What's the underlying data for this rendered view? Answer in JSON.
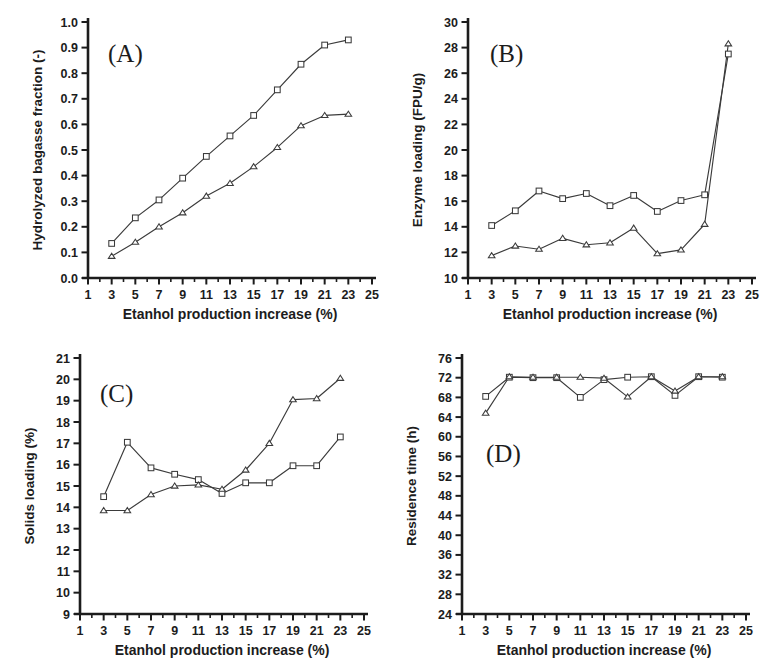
{
  "figure": {
    "background_color": "#ffffff",
    "ink_color": "#1c1c1c",
    "line_color": "#3b3b3b",
    "marker_fill": "#ffffff",
    "shared_xlabel": "Etanhol production increase (%)",
    "shared_xticks": [
      1,
      3,
      5,
      7,
      9,
      11,
      13,
      15,
      17,
      19,
      21,
      23,
      25
    ],
    "shared_xlim": [
      1,
      25
    ],
    "series_names": [
      "square-series",
      "triangle-series"
    ]
  },
  "panels": {
    "a": {
      "tag": "(A)",
      "ylabel": "Hydrolyzed bagasse fraction (-)"
    },
    "b": {
      "tag": "(B)",
      "ylabel": "Enzyme loading (FPU/g)"
    },
    "c": {
      "tag": "(C)",
      "ylabel": "Solids loading (%)"
    },
    "d": {
      "tag": "(D)",
      "ylabel": "Residence time (h)"
    }
  },
  "chart_data": [
    {
      "id": "panel-a",
      "type": "line",
      "title": "(A)",
      "xlabel": "Etanhol production increase (%)",
      "ylabel": "Hydrolyzed bagasse fraction (-)",
      "x": [
        3,
        5,
        7,
        9,
        11,
        13,
        15,
        17,
        19,
        21,
        23
      ],
      "xlim": [
        1,
        25
      ],
      "ylim": [
        0.0,
        1.0
      ],
      "xticks": [
        1,
        3,
        5,
        7,
        9,
        11,
        13,
        15,
        17,
        19,
        21,
        23,
        25
      ],
      "yticks": [
        0.0,
        0.1,
        0.2,
        0.3,
        0.4,
        0.5,
        0.6,
        0.7,
        0.8,
        0.9,
        1.0
      ],
      "ytick_labels": [
        "0.0",
        "0.1",
        "0.2",
        "0.3",
        "0.4",
        "0.5",
        "0.6",
        "0.7",
        "0.8",
        "0.9",
        "1.0"
      ],
      "grid": false,
      "legend": "none",
      "series": [
        {
          "name": "square-series",
          "marker": "square",
          "values": [
            0.135,
            0.235,
            0.305,
            0.39,
            0.475,
            0.555,
            0.635,
            0.735,
            0.835,
            0.91,
            0.93
          ]
        },
        {
          "name": "triangle-series",
          "marker": "triangle",
          "values": [
            0.085,
            0.14,
            0.2,
            0.255,
            0.32,
            0.37,
            0.435,
            0.51,
            0.595,
            0.635,
            0.64
          ]
        }
      ]
    },
    {
      "id": "panel-b",
      "type": "line",
      "title": "(B)",
      "xlabel": "Etanhol production increase (%)",
      "ylabel": "Enzyme loading (FPU/g)",
      "x": [
        3,
        5,
        7,
        9,
        11,
        13,
        15,
        17,
        19,
        21,
        23
      ],
      "xlim": [
        1,
        25
      ],
      "ylim": [
        10,
        30
      ],
      "xticks": [
        1,
        3,
        5,
        7,
        9,
        11,
        13,
        15,
        17,
        19,
        21,
        23,
        25
      ],
      "yticks": [
        10,
        12,
        14,
        16,
        18,
        20,
        22,
        24,
        26,
        28,
        30
      ],
      "ytick_labels": [
        "10",
        "12",
        "14",
        "16",
        "18",
        "20",
        "22",
        "24",
        "26",
        "28",
        "30"
      ],
      "grid": false,
      "legend": "none",
      "series": [
        {
          "name": "square-series",
          "marker": "square",
          "values": [
            14.1,
            15.25,
            16.8,
            16.2,
            16.6,
            15.65,
            16.45,
            15.2,
            16.05,
            16.5,
            27.5
          ]
        },
        {
          "name": "triangle-series",
          "marker": "triangle",
          "values": [
            11.75,
            12.5,
            12.25,
            13.1,
            12.6,
            12.75,
            13.9,
            11.9,
            12.2,
            14.2,
            28.3
          ]
        }
      ]
    },
    {
      "id": "panel-c",
      "type": "line",
      "title": "(C)",
      "xlabel": "Etanhol production increase (%)",
      "ylabel": "Solids loading (%)",
      "x": [
        3,
        5,
        7,
        9,
        11,
        13,
        15,
        17,
        19,
        21,
        23
      ],
      "xlim": [
        1,
        25
      ],
      "ylim": [
        9,
        21
      ],
      "xticks": [
        1,
        3,
        5,
        7,
        9,
        11,
        13,
        15,
        17,
        19,
        21,
        23,
        25
      ],
      "yticks": [
        9,
        10,
        11,
        12,
        13,
        14,
        15,
        16,
        17,
        18,
        19,
        20,
        21
      ],
      "ytick_labels": [
        "9",
        "10",
        "11",
        "12",
        "13",
        "14",
        "15",
        "16",
        "17",
        "18",
        "19",
        "20",
        "21"
      ],
      "grid": false,
      "legend": "none",
      "series": [
        {
          "name": "square-series",
          "marker": "square",
          "values": [
            14.5,
            17.05,
            15.85,
            15.55,
            15.3,
            14.65,
            15.15,
            15.15,
            15.95,
            15.95,
            17.3
          ]
        },
        {
          "name": "triangle-series",
          "marker": "triangle",
          "values": [
            13.85,
            13.85,
            14.6,
            15.0,
            15.05,
            14.85,
            15.75,
            17.0,
            19.05,
            19.1,
            20.05
          ]
        }
      ]
    },
    {
      "id": "panel-d",
      "type": "line",
      "title": "(D)",
      "xlabel": "Etanhol production increase (%)",
      "ylabel": "Residence time (h)",
      "x": [
        3,
        5,
        7,
        9,
        11,
        13,
        15,
        17,
        19,
        21,
        23
      ],
      "xlim": [
        1,
        25
      ],
      "ylim": [
        24,
        76
      ],
      "xticks": [
        1,
        3,
        5,
        7,
        9,
        11,
        13,
        15,
        17,
        19,
        21,
        23,
        25
      ],
      "yticks": [
        24,
        28,
        32,
        36,
        40,
        44,
        48,
        52,
        56,
        60,
        64,
        68,
        72,
        76
      ],
      "ytick_labels": [
        "24",
        "28",
        "32",
        "36",
        "40",
        "44",
        "48",
        "52",
        "56",
        "60",
        "64",
        "68",
        "72",
        "76"
      ],
      "grid": false,
      "legend": "none",
      "series": [
        {
          "name": "square-series",
          "marker": "square",
          "values": [
            68.2,
            72.1,
            72.0,
            72.0,
            68.0,
            71.6,
            72.1,
            72.2,
            68.4,
            72.2,
            72.1
          ]
        },
        {
          "name": "triangle-series",
          "marker": "triangle",
          "values": [
            64.8,
            72.2,
            72.1,
            72.1,
            72.1,
            71.9,
            68.1,
            72.2,
            69.3,
            72.2,
            72.2
          ]
        }
      ]
    }
  ]
}
